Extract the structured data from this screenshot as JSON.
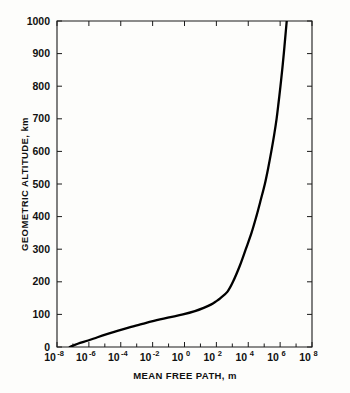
{
  "chart_data": {
    "type": "line",
    "title": "",
    "xlabel": "MEAN FREE PATH, m",
    "ylabel": "GEOMETRIC ALTITUDE, km",
    "xscale": "log",
    "yscale": "linear",
    "xlim": [
      1e-08,
      100000000.0
    ],
    "ylim": [
      0,
      1000
    ],
    "grid": false,
    "legend": null,
    "x_tick_labels": [
      {
        "mantissa": "10",
        "exponent": "-8",
        "value": 1e-08
      },
      {
        "mantissa": "10",
        "exponent": "-6",
        "value": 1e-06
      },
      {
        "mantissa": "10",
        "exponent": "-4",
        "value": 0.0001
      },
      {
        "mantissa": "10",
        "exponent": "-2",
        "value": 0.01
      },
      {
        "mantissa": "10",
        "exponent": "0",
        "value": 1
      },
      {
        "mantissa": "10",
        "exponent": "2",
        "value": 100
      },
      {
        "mantissa": "10",
        "exponent": "4",
        "value": 10000
      },
      {
        "mantissa": "10",
        "exponent": "6",
        "value": 1000000
      },
      {
        "mantissa": "10",
        "exponent": "8",
        "value": 100000000
      }
    ],
    "y_tick_labels": [
      "0",
      "100",
      "200",
      "300",
      "400",
      "500",
      "600",
      "700",
      "800",
      "900",
      "1000"
    ],
    "y_tick_values": [
      0,
      100,
      200,
      300,
      400,
      500,
      600,
      700,
      800,
      900,
      1000
    ],
    "series": [
      {
        "name": "mean free path vs geometric altitude",
        "points": [
          {
            "mean_free_path_m": 6.3e-08,
            "altitude_km": 0
          },
          {
            "mean_free_path_m": 2e-07,
            "altitude_km": 10
          },
          {
            "mean_free_path_m": 9e-07,
            "altitude_km": 20
          },
          {
            "mean_free_path_m": 3.5e-06,
            "altitude_km": 30
          },
          {
            "mean_free_path_m": 1.5e-05,
            "altitude_km": 40
          },
          {
            "mean_free_path_m": 7e-05,
            "altitude_km": 50
          },
          {
            "mean_free_path_m": 0.00035,
            "altitude_km": 60
          },
          {
            "mean_free_path_m": 0.002,
            "altitude_km": 70
          },
          {
            "mean_free_path_m": 0.012,
            "altitude_km": 80
          },
          {
            "mean_free_path_m": 0.09,
            "altitude_km": 90
          },
          {
            "mean_free_path_m": 0.8,
            "altitude_km": 100
          },
          {
            "mean_free_path_m": 4.5,
            "altitude_km": 110
          },
          {
            "mean_free_path_m": 16,
            "altitude_km": 120
          },
          {
            "mean_free_path_m": 45,
            "altitude_km": 130
          },
          {
            "mean_free_path_m": 95,
            "altitude_km": 140
          },
          {
            "mean_free_path_m": 180.0,
            "altitude_km": 150
          },
          {
            "mean_free_path_m": 500.0,
            "altitude_km": 170
          },
          {
            "mean_free_path_m": 1100.0,
            "altitude_km": 200
          },
          {
            "mean_free_path_m": 3000.0,
            "altitude_km": 250
          },
          {
            "mean_free_path_m": 7000.0,
            "altitude_km": 300
          },
          {
            "mean_free_path_m": 16000.0,
            "altitude_km": 350
          },
          {
            "mean_free_path_m": 32000.0,
            "altitude_km": 400
          },
          {
            "mean_free_path_m": 60000.0,
            "altitude_km": 450
          },
          {
            "mean_free_path_m": 110000.0,
            "altitude_km": 500
          },
          {
            "mean_free_path_m": 180000.0,
            "altitude_km": 550
          },
          {
            "mean_free_path_m": 280000.0,
            "altitude_km": 600
          },
          {
            "mean_free_path_m": 420000.0,
            "altitude_km": 650
          },
          {
            "mean_free_path_m": 600000.0,
            "altitude_km": 700
          },
          {
            "mean_free_path_m": 800000.0,
            "altitude_km": 750
          },
          {
            "mean_free_path_m": 1050000.0,
            "altitude_km": 800
          },
          {
            "mean_free_path_m": 1350000.0,
            "altitude_km": 850
          },
          {
            "mean_free_path_m": 1700000.0,
            "altitude_km": 900
          },
          {
            "mean_free_path_m": 2100000.0,
            "altitude_km": 950
          },
          {
            "mean_free_path_m": 2600000.0,
            "altitude_km": 1000
          }
        ]
      }
    ]
  },
  "colors": {
    "curve": "#000000",
    "axis": "#1a1a1a",
    "background": "#fdfdfb",
    "text": "#111111"
  }
}
